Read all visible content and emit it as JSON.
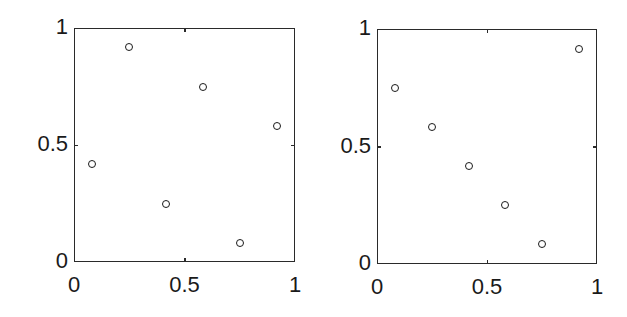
{
  "chart_data": [
    {
      "type": "scatter",
      "title": "",
      "xlabel": "",
      "ylabel": "",
      "xlim": [
        0,
        1
      ],
      "ylim": [
        0,
        1
      ],
      "grid": false,
      "xticks": [
        "0",
        "0.5",
        "1"
      ],
      "yticks": [
        "0",
        "0.5",
        "1"
      ],
      "marker": "open-circle",
      "series": [
        {
          "name": "points",
          "x": [
            0.083,
            0.25,
            0.417,
            0.583,
            0.75,
            0.917
          ],
          "y": [
            0.417,
            0.917,
            0.25,
            0.75,
            0.083,
            0.583
          ]
        }
      ]
    },
    {
      "type": "scatter",
      "title": "",
      "xlabel": "",
      "ylabel": "",
      "xlim": [
        0,
        1
      ],
      "ylim": [
        0,
        1
      ],
      "grid": false,
      "xticks": [
        "0",
        "0.5",
        "1"
      ],
      "yticks": [
        "0",
        "0.5",
        "1"
      ],
      "marker": "open-circle",
      "series": [
        {
          "name": "points",
          "x": [
            0.083,
            0.25,
            0.417,
            0.583,
            0.75,
            0.917
          ],
          "y": [
            0.75,
            0.583,
            0.417,
            0.25,
            0.083,
            0.917
          ]
        }
      ]
    }
  ],
  "layout": {
    "panels": [
      {
        "left": 74,
        "top": 28,
        "width": 221,
        "height": 234
      },
      {
        "left": 377,
        "top": 29,
        "width": 220,
        "height": 235
      }
    ]
  }
}
